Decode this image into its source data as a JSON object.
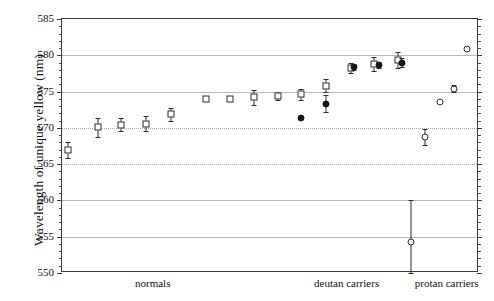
{
  "chart_data": {
    "type": "scatter",
    "title": "",
    "xlabel": "",
    "ylabel": "Wavelength of unique yellow (nm)",
    "ylim": [
      550,
      585
    ],
    "ytick_labels": [
      "585",
      "580",
      "575",
      "570",
      "565",
      "560",
      "555",
      "550"
    ],
    "ytick_values": [
      585,
      580,
      575,
      570,
      565,
      560,
      555,
      550
    ],
    "ytick_minor_step": 1,
    "grid": "horizontal-major",
    "legend": "none",
    "xaxis_groups": [
      {
        "label": "normals",
        "center_x": 0.22
      },
      {
        "label": "deutan carriers",
        "center_x": 0.685
      },
      {
        "label": "protan carriers",
        "center_x": 0.925
      }
    ],
    "series": [
      {
        "name": "normals",
        "marker": "open-square",
        "points": [
          {
            "x": 0.0145,
            "y": 567.0,
            "err_low": 565.9,
            "err_high": 568.1
          },
          {
            "x": 0.0855,
            "y": 570.1,
            "err_low": 568.8,
            "err_high": 571.4
          },
          {
            "x": 0.142,
            "y": 570.4,
            "err_low": 569.6,
            "err_high": 571.3
          },
          {
            "x": 0.201,
            "y": 570.5,
            "err_low": 569.5,
            "err_high": 571.6
          },
          {
            "x": 0.262,
            "y": 571.9,
            "err_low": 571.0,
            "err_high": 572.8
          },
          {
            "x": 0.345,
            "y": 574.0,
            "err_low": 573.8,
            "err_high": 574.2
          },
          {
            "x": 0.403,
            "y": 574.0,
            "err_low": 573.8,
            "err_high": 574.2
          },
          {
            "x": 0.461,
            "y": 574.2,
            "err_low": 573.2,
            "err_high": 575.2
          },
          {
            "x": 0.518,
            "y": 574.4,
            "err_low": 573.9,
            "err_high": 574.9
          },
          {
            "x": 0.574,
            "y": 574.6,
            "err_low": 573.9,
            "err_high": 575.3
          },
          {
            "x": 0.632,
            "y": 575.8,
            "err_low": 574.9,
            "err_high": 576.7
          },
          {
            "x": 0.692,
            "y": 578.3,
            "err_low": 577.6,
            "err_high": 579.0
          },
          {
            "x": 0.749,
            "y": 578.8,
            "err_low": 577.8,
            "err_high": 579.8
          },
          {
            "x": 0.806,
            "y": 579.3,
            "err_low": 578.2,
            "err_high": 580.4
          }
        ]
      },
      {
        "name": "deutan carriers",
        "marker": "filled-circle",
        "points": [
          {
            "x": 0.573,
            "y": 571.3,
            "err_low": 571.3,
            "err_high": 571.3
          },
          {
            "x": 0.633,
            "y": 573.3,
            "err_low": 572.2,
            "err_high": 574.5
          },
          {
            "x": 0.7,
            "y": 578.4,
            "err_low": 578.0,
            "err_high": 578.8
          },
          {
            "x": 0.76,
            "y": 578.7,
            "err_low": 578.3,
            "err_high": 579.1
          },
          {
            "x": 0.815,
            "y": 579.0,
            "err_low": 578.4,
            "err_high": 579.6
          }
        ]
      },
      {
        "name": "protan carriers",
        "marker": "open-circle",
        "points": [
          {
            "x": 0.837,
            "y": 554.3,
            "err_low": 550.0,
            "err_high": 560.0
          },
          {
            "x": 0.87,
            "y": 568.8,
            "err_low": 567.7,
            "err_high": 569.9
          },
          {
            "x": 0.906,
            "y": 573.5,
            "err_low": 573.5,
            "err_high": 573.5
          },
          {
            "x": 0.94,
            "y": 575.4,
            "err_low": 575.0,
            "err_high": 575.9
          },
          {
            "x": 0.972,
            "y": 580.8,
            "err_low": 580.8,
            "err_high": 580.8
          }
        ]
      }
    ]
  }
}
